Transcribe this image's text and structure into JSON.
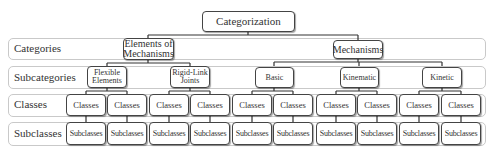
{
  "diagram": {
    "root": "Categorization",
    "levels": [
      {
        "label": "Categories"
      },
      {
        "label": "Subcategories"
      },
      {
        "label": "Classes"
      },
      {
        "label": "Subclasses"
      }
    ],
    "categories": [
      {
        "label": "Elements of Mechanisms",
        "subcategories": [
          {
            "label": "Flexible Elements"
          },
          {
            "label": "Rigid-Link Joints"
          }
        ]
      },
      {
        "label": "Mechanisms",
        "subcategories": [
          {
            "label": "Basic"
          },
          {
            "label": "Kinematic"
          },
          {
            "label": "Kinetic"
          }
        ]
      }
    ],
    "class_label": "Classes",
    "subclass_label": "Subclasses",
    "classes": [
      "Classes",
      "Classes",
      "Classes",
      "Classes",
      "Classes",
      "Classes",
      "Classes",
      "Classes",
      "Classes",
      "Classes",
      "Classes",
      "Classes"
    ],
    "subclasses": [
      "Subclasses",
      "Subclasses",
      "Subclasses",
      "Subclasses",
      "Subclasses",
      "Subclasses",
      "Subclasses",
      "Subclasses",
      "Subclasses",
      "Subclasses",
      "Subclasses",
      "Subclasses"
    ],
    "colors": {
      "node_border": "#444444",
      "band_border": "#c9c9c9",
      "text": "#333333"
    }
  }
}
